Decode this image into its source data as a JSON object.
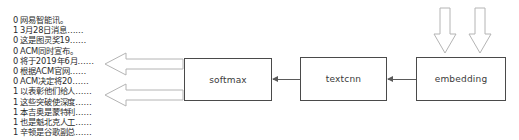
{
  "diagram": {
    "colors": {
      "background": "#ffffff",
      "box_border": "#4a4a4a",
      "box_fill": "#ffffff",
      "text": "#3a3a3a",
      "sample_text": "#2b2b2b",
      "connector": "#5a5a5a",
      "block_arrow_stroke": "#b4b4b4"
    }
  },
  "samples": {
    "rows": [
      {
        "label": "0",
        "text": "网易智能讯。"
      },
      {
        "label": "1",
        "text": "3月28日消息……"
      },
      {
        "label": "0",
        "text": "这是图灵奖19……"
      },
      {
        "label": "0",
        "text": "ACM同时宣布。"
      },
      {
        "label": "0",
        "text": "将于2019年6月……"
      },
      {
        "label": "0",
        "text": "根据ACM官网……"
      },
      {
        "label": "0",
        "text": "ACM决定将20……"
      },
      {
        "label": "1",
        "text": "以表彰他们给人……"
      },
      {
        "label": "1",
        "text": "这些突破使深度……"
      },
      {
        "label": "1",
        "text": "本吉奥是蒙特利……"
      },
      {
        "label": "1",
        "text": "也是魁北克人工……"
      },
      {
        "label": "1",
        "text": "辛顿是谷歌副总……"
      }
    ]
  },
  "pipeline": {
    "stages": [
      {
        "id": "softmax",
        "label": "softmax"
      },
      {
        "id": "textcnn",
        "label": "textcnn"
      },
      {
        "id": "embedding",
        "label": "embedding"
      }
    ],
    "connectors": [
      {
        "from": "textcnn",
        "to": "softmax",
        "direction": "left"
      },
      {
        "from": "embedding",
        "to": "textcnn",
        "direction": "left"
      }
    ],
    "block_arrows": {
      "left": [
        {
          "name": "output-arrow-top",
          "direction": "left"
        },
        {
          "name": "output-arrow-bottom",
          "direction": "left"
        }
      ],
      "down": [
        {
          "name": "input-arrow-left",
          "direction": "down"
        },
        {
          "name": "input-arrow-right",
          "direction": "down"
        }
      ]
    }
  }
}
